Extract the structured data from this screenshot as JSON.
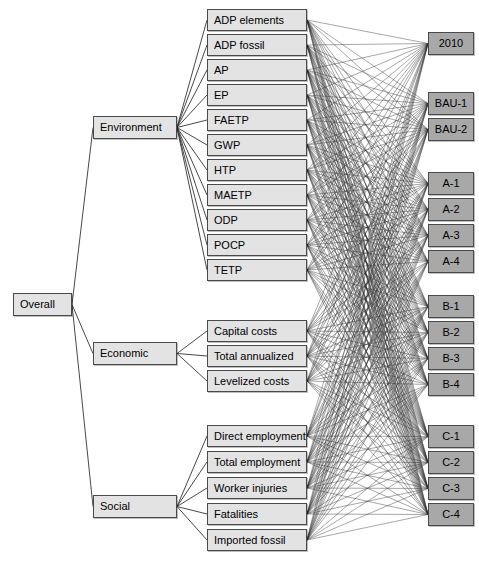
{
  "diagram": {
    "type": "hierarchy-network",
    "colors": {
      "criteria_fill": "#e3e3e3",
      "option_fill": "#a8a8a8",
      "border": "#4a4a4a",
      "edge": "#333333",
      "background": "#ffffff"
    },
    "goal": {
      "label": "Overall",
      "x": 13,
      "y": 293,
      "w": 59,
      "h": 23
    },
    "criteria": [
      {
        "id": "environment",
        "label": "Environment",
        "x": 93,
        "y": 116,
        "w": 84,
        "h": 23
      },
      {
        "id": "economic",
        "label": "Economic",
        "x": 93,
        "y": 342,
        "w": 84,
        "h": 23
      },
      {
        "id": "social",
        "label": "Social",
        "x": 93,
        "y": 495,
        "w": 84,
        "h": 23
      }
    ],
    "subcriteria": [
      {
        "id": "adp-elements",
        "label": "ADP elements",
        "parent": "environment",
        "x": 207,
        "y": 9,
        "w": 100,
        "h": 22
      },
      {
        "id": "adp-fossil",
        "label": "ADP fossil",
        "parent": "environment",
        "x": 207,
        "y": 34,
        "w": 100,
        "h": 22
      },
      {
        "id": "ap",
        "label": "AP",
        "parent": "environment",
        "x": 207,
        "y": 59,
        "w": 100,
        "h": 22
      },
      {
        "id": "ep",
        "label": "EP",
        "parent": "environment",
        "x": 207,
        "y": 84,
        "w": 100,
        "h": 22
      },
      {
        "id": "faetp",
        "label": "FAETP",
        "parent": "environment",
        "x": 207,
        "y": 109,
        "w": 100,
        "h": 22
      },
      {
        "id": "gwp",
        "label": "GWP",
        "parent": "environment",
        "x": 207,
        "y": 134,
        "w": 100,
        "h": 22
      },
      {
        "id": "htp",
        "label": "HTP",
        "parent": "environment",
        "x": 207,
        "y": 159,
        "w": 100,
        "h": 22
      },
      {
        "id": "maetp",
        "label": "MAETP",
        "parent": "environment",
        "x": 207,
        "y": 184,
        "w": 100,
        "h": 22
      },
      {
        "id": "odp",
        "label": "ODP",
        "parent": "environment",
        "x": 207,
        "y": 209,
        "w": 100,
        "h": 22
      },
      {
        "id": "pocp",
        "label": "POCP",
        "parent": "environment",
        "x": 207,
        "y": 234,
        "w": 100,
        "h": 22
      },
      {
        "id": "tetp",
        "label": "TETP",
        "parent": "environment",
        "x": 207,
        "y": 259,
        "w": 100,
        "h": 22
      },
      {
        "id": "capital-costs",
        "label": "Capital costs",
        "parent": "economic",
        "x": 207,
        "y": 320,
        "w": 100,
        "h": 22
      },
      {
        "id": "total-annualized",
        "label": "Total annualized",
        "parent": "economic",
        "x": 207,
        "y": 345,
        "w": 100,
        "h": 22
      },
      {
        "id": "levelized-costs",
        "label": "Levelized costs",
        "parent": "economic",
        "x": 207,
        "y": 370,
        "w": 100,
        "h": 22
      },
      {
        "id": "direct-employment",
        "label": "Direct employment",
        "parent": "social",
        "x": 207,
        "y": 425,
        "w": 100,
        "h": 22
      },
      {
        "id": "total-employment",
        "label": "Total employment",
        "parent": "social",
        "x": 207,
        "y": 451,
        "w": 100,
        "h": 22
      },
      {
        "id": "worker-injuries",
        "label": "Worker injuries",
        "parent": "social",
        "x": 207,
        "y": 477,
        "w": 100,
        "h": 22
      },
      {
        "id": "fatalities",
        "label": "Fatalities",
        "parent": "social",
        "x": 207,
        "y": 503,
        "w": 100,
        "h": 22
      },
      {
        "id": "imported-fossil",
        "label": "Imported fossil",
        "parent": "social",
        "x": 207,
        "y": 529,
        "w": 100,
        "h": 22
      }
    ],
    "options": [
      {
        "id": "2010",
        "label": "2010",
        "x": 428,
        "y": 32,
        "w": 46,
        "h": 23
      },
      {
        "id": "bau-1",
        "label": "BAU-1",
        "x": 428,
        "y": 92,
        "w": 46,
        "h": 23
      },
      {
        "id": "bau-2",
        "label": "BAU-2",
        "x": 428,
        "y": 118,
        "w": 46,
        "h": 23
      },
      {
        "id": "a-1",
        "label": "A-1",
        "x": 428,
        "y": 172,
        "w": 46,
        "h": 23
      },
      {
        "id": "a-2",
        "label": "A-2",
        "x": 428,
        "y": 198,
        "w": 46,
        "h": 23
      },
      {
        "id": "a-3",
        "label": "A-3",
        "x": 428,
        "y": 224,
        "w": 46,
        "h": 23
      },
      {
        "id": "a-4",
        "label": "A-4",
        "x": 428,
        "y": 250,
        "w": 46,
        "h": 23
      },
      {
        "id": "b-1",
        "label": "B-1",
        "x": 428,
        "y": 295,
        "w": 46,
        "h": 23
      },
      {
        "id": "b-2",
        "label": "B-2",
        "x": 428,
        "y": 321,
        "w": 46,
        "h": 23
      },
      {
        "id": "b-3",
        "label": "B-3",
        "x": 428,
        "y": 347,
        "w": 46,
        "h": 23
      },
      {
        "id": "b-4",
        "label": "B-4",
        "x": 428,
        "y": 373,
        "w": 46,
        "h": 23
      },
      {
        "id": "c-1",
        "label": "C-1",
        "x": 428,
        "y": 425,
        "w": 46,
        "h": 23
      },
      {
        "id": "c-2",
        "label": "C-2",
        "x": 428,
        "y": 451,
        "w": 46,
        "h": 23
      },
      {
        "id": "c-3",
        "label": "C-3",
        "x": 428,
        "y": 477,
        "w": 46,
        "h": 23
      },
      {
        "id": "c-4",
        "label": "C-4",
        "x": 428,
        "y": 503,
        "w": 46,
        "h": 23
      }
    ],
    "edges": {
      "goal_to_criteria": true,
      "criteria_to_subcriteria": true,
      "subcriteria_to_options": "complete-bipartite"
    }
  }
}
